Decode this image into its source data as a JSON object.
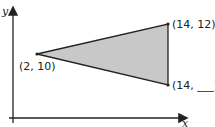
{
  "axes": {
    "y_label": "y",
    "x_label": "x"
  },
  "triangle": {
    "fill": "#c8c8c8",
    "stroke": "#222222",
    "vertices": [
      {
        "label": "(2, 10)",
        "x": 2,
        "y": 10
      },
      {
        "label": "(14, 12)",
        "x": 14,
        "y": 12
      },
      {
        "label": "(14, ___)",
        "x": 14,
        "y": null
      }
    ]
  }
}
